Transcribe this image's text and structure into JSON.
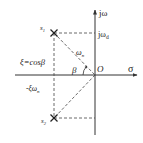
{
  "diagram": {
    "type": "s-plane pole diagram",
    "axes": {
      "horizontal_label": "σ",
      "vertical_label": "jω",
      "origin_label": "O"
    },
    "poles": [
      {
        "name": "s1",
        "label_main": "s",
        "label_sub": "1",
        "marker": "x"
      },
      {
        "name": "s2",
        "label_main": "s",
        "label_sub": "2",
        "marker": "x"
      }
    ],
    "labels": {
      "jwd_main": "jω",
      "jwd_sub": "d",
      "omega_n_main": "ω",
      "omega_n_sub": "n",
      "beta": "β",
      "damping_relation": "ξ=cosβ",
      "neg_xi_wn_main": "-ξω",
      "neg_xi_wn_sub": "n"
    },
    "colors": {
      "line": "#333333",
      "text": "#222222",
      "background": "#ffffff"
    }
  }
}
